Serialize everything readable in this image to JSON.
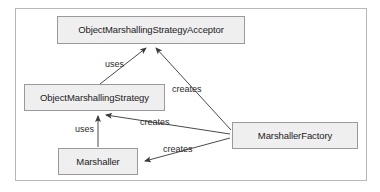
{
  "diagram": {
    "background_color": "#ffffff",
    "frame_color": "#b8b8b8",
    "node_fill": "#efefef",
    "node_border": "#9a9a9a",
    "edge_color": "#4a4a4a",
    "nodes": [
      {
        "id": "acceptor",
        "label": "ObjectMarshallingStrategyAcceptor"
      },
      {
        "id": "strategy",
        "label": "ObjectMarshallingStrategy"
      },
      {
        "id": "factory",
        "label": "MarshallerFactory"
      },
      {
        "id": "marshaller",
        "label": "Marshaller"
      }
    ],
    "edges": [
      {
        "id": "e1",
        "from": "strategy",
        "to": "acceptor",
        "label": "uses"
      },
      {
        "id": "e2",
        "from": "factory",
        "to": "acceptor",
        "label": "creates"
      },
      {
        "id": "e3",
        "from": "factory",
        "to": "strategy",
        "label": "creates"
      },
      {
        "id": "e4",
        "from": "marshaller",
        "to": "strategy",
        "label": "uses"
      },
      {
        "id": "e5",
        "from": "factory",
        "to": "marshaller",
        "label": "creates"
      }
    ]
  }
}
